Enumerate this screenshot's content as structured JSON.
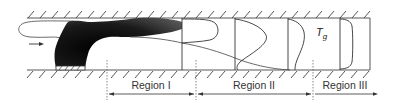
{
  "diagram": {
    "type": "combustion-channel-regions",
    "elements": {
      "inflow_arrow": "arrow-right",
      "flame": "dark-flame-body",
      "burner": "hatched-burner-base",
      "temperature_label": {
        "symbol": "T",
        "subscript": "g"
      },
      "profiles_count": 4
    },
    "regions": [
      {
        "label": "Region I"
      },
      {
        "label": "Region II"
      },
      {
        "label": "Region III"
      }
    ],
    "colors": {
      "line": "#333333",
      "flame": "#111111",
      "background": "#ffffff"
    }
  }
}
